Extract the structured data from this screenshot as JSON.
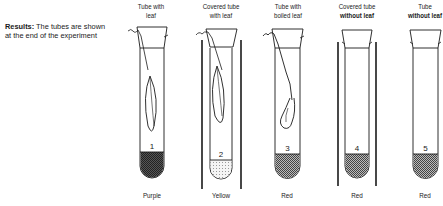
{
  "results": {
    "heading": "Results:",
    "text_line1": "The tubes are shown",
    "text_line2": "at the end of the experiment"
  },
  "tubes": [
    {
      "number": "1",
      "title_line1": "Tube with",
      "title_line2": "leaf",
      "title_line2_bold": false,
      "covered": false,
      "contents": "leaf",
      "result": "Purple",
      "liquid_pattern": "dark"
    },
    {
      "number": "2",
      "title_line1": "Covered tube",
      "title_line2": "with leaf",
      "title_line2_bold": false,
      "covered": true,
      "contents": "leaf",
      "result": "Yellow",
      "liquid_pattern": "light"
    },
    {
      "number": "3",
      "title_line1": "Tube with",
      "title_line2": "boiled leaf",
      "title_line2_bold": false,
      "covered": false,
      "contents": "boiled leaf",
      "result": "Red",
      "liquid_pattern": "medium"
    },
    {
      "number": "4",
      "title_line1": "Covered tube",
      "title_line2": "without leaf",
      "title_line2_bold": true,
      "covered": true,
      "contents": "none",
      "result": "Red",
      "liquid_pattern": "medium"
    },
    {
      "number": "5",
      "title_line1": "Tube",
      "title_line2": "without leaf",
      "title_line2_bold": true,
      "covered": false,
      "contents": "none",
      "result": "Red",
      "liquid_pattern": "medium"
    }
  ],
  "colors": {
    "ink": "#1a1a1a",
    "background": "#ffffff"
  }
}
